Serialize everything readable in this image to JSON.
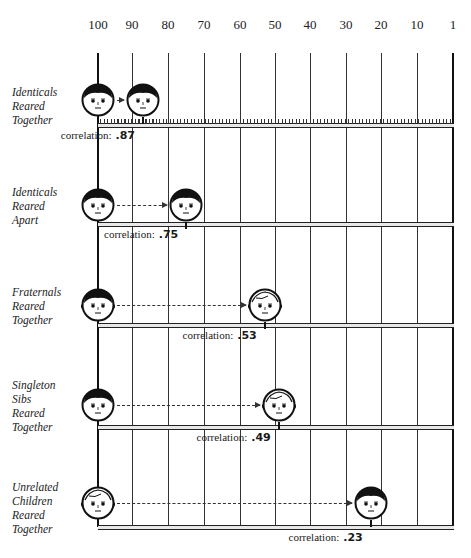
{
  "axis": {
    "ticks": [
      "100",
      "90",
      "80",
      "70",
      "60",
      "50",
      "40",
      "30",
      "20",
      "10",
      "1"
    ],
    "tick_x": [
      98,
      132,
      168,
      204,
      240,
      275,
      310,
      346,
      381,
      417,
      453
    ]
  },
  "rows": [
    {
      "label_lines": [
        "Identicals",
        "Reared",
        "Together"
      ],
      "correlation_label": "correlation:",
      "value": ".87",
      "from_face": "boy",
      "to_face": "boy"
    },
    {
      "label_lines": [
        "Identicals",
        "Reared",
        "Apart"
      ],
      "correlation_label": "correlation:",
      "value": ".75",
      "from_face": "boy",
      "to_face": "boy"
    },
    {
      "label_lines": [
        "Fraternals",
        "Reared",
        "Together"
      ],
      "correlation_label": "correlation:",
      "value": ".53",
      "from_face": "girl",
      "to_face": "boy-light"
    },
    {
      "label_lines": [
        "Singleton",
        "Sibs",
        "Reared",
        "Together"
      ],
      "correlation_label": "correlation:",
      "value": ".49",
      "from_face": "boy",
      "to_face": "girl-light"
    },
    {
      "label_lines": [
        "Unrelated",
        "Children",
        "Reared",
        "Together"
      ],
      "correlation_label": "correlation:",
      "value": ".23",
      "from_face": "boy-light",
      "to_face": "boy"
    }
  ],
  "chart_data": {
    "type": "bar",
    "title": "",
    "xlabel": "",
    "ylabel": "",
    "x_axis_ticks": [
      "100",
      "90",
      "80",
      "70",
      "60",
      "50",
      "40",
      "30",
      "20",
      "10",
      "1"
    ],
    "x_axis_direction": "descending left to right",
    "categories": [
      "Identicals Reared Together",
      "Identicals Reared Apart",
      "Fraternals Reared Together",
      "Singleton Sibs Reared Together",
      "Unrelated Children Reared Together"
    ],
    "series": [
      {
        "name": "correlation",
        "values": [
          0.87,
          0.75,
          0.53,
          0.49,
          0.23
        ]
      }
    ],
    "annotations": [
      "correlation: .87",
      "correlation: .75",
      "correlation: .53",
      "correlation: .49",
      "correlation: .23"
    ],
    "grid": true,
    "legend": null
  }
}
